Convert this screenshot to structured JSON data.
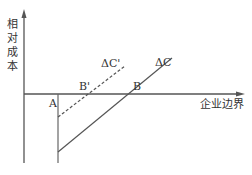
{
  "diagram": {
    "type": "economics-cost-curve",
    "y_axis_label": [
      "相",
      "对",
      "成",
      "本"
    ],
    "x_axis_label": "企业边界",
    "curves": [
      {
        "name": "ΔC",
        "style": "solid",
        "label": "ΔC"
      },
      {
        "name": "ΔC'",
        "style": "dashed",
        "label": "ΔC'"
      }
    ],
    "points": {
      "A": "A",
      "B": "B",
      "B_prime": "B'"
    },
    "colors": {
      "line": "#555555",
      "text": "#333333",
      "background": "#ffffff"
    }
  }
}
